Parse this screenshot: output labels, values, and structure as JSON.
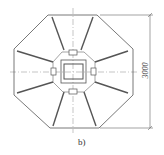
{
  "figure": {
    "caption": "b)",
    "caption_pos": {
      "x": 78,
      "y": 137
    },
    "dimension": {
      "label": "3000",
      "x": 150,
      "y_top": 15,
      "y_bottom": 128,
      "ext_from_x": 100,
      "label_pos": {
        "x": 137,
        "y": 66
      }
    },
    "octagon": {
      "points": "48,15 97,15 133,49 133,95 99,128 50,128 14,95 14,49",
      "stroke": "#555555"
    },
    "ribs": [
      {
        "x1": 52,
        "y1": 17,
        "x2": 64,
        "y2": 50
      },
      {
        "x1": 93,
        "y1": 17,
        "x2": 81,
        "y2": 50
      },
      {
        "x1": 128,
        "y1": 51,
        "x2": 95,
        "y2": 62
      },
      {
        "x1": 128,
        "y1": 93,
        "x2": 95,
        "y2": 82
      },
      {
        "x1": 96,
        "y1": 126,
        "x2": 84,
        "y2": 92
      },
      {
        "x1": 53,
        "y1": 126,
        "x2": 64,
        "y2": 92
      },
      {
        "x1": 17,
        "y1": 93,
        "x2": 53,
        "y2": 82
      },
      {
        "x1": 17,
        "y1": 51,
        "x2": 53,
        "y2": 62
      }
    ],
    "inner_octagon": {
      "points": "62,52 84,52 95,62 95,82 84,92 63,92 53,82 53,62"
    },
    "notches": [
      {
        "x": 69,
        "y": 50,
        "w": 8,
        "h": 5
      },
      {
        "x": 69,
        "y": 89,
        "w": 8,
        "h": 5
      },
      {
        "x": 51,
        "y": 68,
        "w": 5,
        "h": 7
      },
      {
        "x": 91,
        "y": 68,
        "w": 5,
        "h": 7
      }
    ],
    "outer_square": {
      "x": 61,
      "y": 60,
      "w": 25,
      "h": 23
    },
    "inner_square": {
      "x": 64,
      "y": 64,
      "w": 19,
      "h": 15
    },
    "center": {
      "x": 73,
      "y": 72
    },
    "centerline_h": {
      "x1": 10,
      "x2": 138
    },
    "centerline_v": {
      "y1": 8,
      "y2": 133
    }
  }
}
